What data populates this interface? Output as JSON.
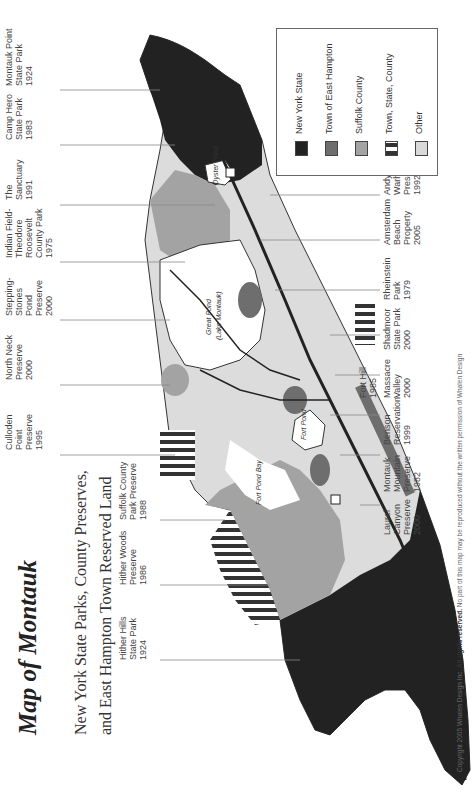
{
  "title": "Map of Montauk",
  "subtitle_line1": "New York State Parks, County Preserves,",
  "subtitle_line2": "and East Hampton Town Reserved Land",
  "legend": {
    "items": [
      {
        "label": "New York State",
        "color": "#222222"
      },
      {
        "label": "Town of East Hampton",
        "color": "#6e6e6e"
      },
      {
        "label": "Suffolk County",
        "color": "#a3a3a3"
      },
      {
        "label": "Town, State, County",
        "color": "striped"
      },
      {
        "label": "Other",
        "color": "#d9d9d9"
      }
    ]
  },
  "labels_top": [
    {
      "name": "Montauk Point State Park",
      "line1": "Montauk Point",
      "line2": "State Park",
      "line3": "1924"
    },
    {
      "name": "Camp Hero State Park",
      "line1": "Camp Hero",
      "line2": "State Park",
      "line3": "1983"
    },
    {
      "name": "The Sanctuary",
      "line1": "The",
      "line2": "Sanctuary",
      "line3": "1991"
    },
    {
      "name": "Indian Field-Theodore Roosevelt County Park",
      "line1": "Indian Field-",
      "line2": "Theodore",
      "line3": "Roosevelt",
      "line4": "County Park",
      "line5": "1975"
    },
    {
      "name": "Stepping-Stones Pond Preserve",
      "line1": "Stepping-",
      "line2": "Stones",
      "line3": "Pond",
      "line4": "Preserve",
      "line5": "2000"
    },
    {
      "name": "North Neck Preserve",
      "line1": "North Neck",
      "line2": "Preserve",
      "line3": "2000"
    },
    {
      "name": "Culloden Point Preserve",
      "line1": "Culloden",
      "line2": "Point",
      "line3": "Preserve",
      "line4": "1995"
    },
    {
      "name": "Suffolk County Park Preserve",
      "line1": "Suffolk County",
      "line2": "Park Preserve",
      "line3": "1988"
    },
    {
      "name": "Hither Woods Preserve",
      "line1": "Hither Woods",
      "line2": "Preserve",
      "line3": "1986"
    },
    {
      "name": "Hither Hills State Park",
      "line1": "Hither Hills",
      "line2": "State Park",
      "line3": "1924"
    }
  ],
  "labels_bottom": [
    {
      "name": "Andy Warhol Preserve",
      "line1": "Andy",
      "line2": "Warhol",
      "line3": "Preserve",
      "line4": "1992"
    },
    {
      "name": "Amsterdam Beach Property",
      "line1": "Amsterdam",
      "line2": "Beach",
      "line3": "Property",
      "line4": "2005"
    },
    {
      "name": "Rheinstein Park",
      "line1": "Rheinstein",
      "line2": "Park",
      "line3": "1979"
    },
    {
      "name": "Shadmoor State Park",
      "line1": "Shadmoor",
      "line2": "State Park",
      "line3": "2000"
    },
    {
      "name": "Massacre Valley",
      "line1": "Massacre",
      "line2": "Valley",
      "line3": "2000"
    },
    {
      "name": "Fort Hill",
      "line1": "Fort Hill",
      "line2": "1985"
    },
    {
      "name": "Benson Reservation",
      "line1": "Benson",
      "line2": "Reservation",
      "line3": "1999"
    },
    {
      "name": "Montauk Mountain Preserve",
      "line1": "Montauk",
      "line2": "Mountain",
      "line3": "Preserve",
      "line4": "1982"
    },
    {
      "name": "Laurel Canyon Preserve",
      "line1": "Laurel",
      "line2": "Canyon",
      "line3": "Preserve",
      "line4": "2000"
    }
  ],
  "map_labels": {
    "great_pond": "Great Pond",
    "lake_montauk": "(Lake Montauk)",
    "fort_pond": "Fort Pond",
    "fort_pond_bay": "Fort Pond Bay",
    "oyster_pond": "Oyster Pond",
    "west_lake_drive": "West Lake Drive",
    "flamingo_road": "Flamingo Road",
    "east_lake_drive": "East Lake Drive",
    "old_montauk_highway": "Old Montauk Highway",
    "route_27": "27"
  },
  "copyright": {
    "prefix": "Copyright 2005 Whalen Design Inc.",
    "bold": "All rights reserved.",
    "suffix": "No part of this map may be reproduced without the written permission of Whalen Design"
  }
}
